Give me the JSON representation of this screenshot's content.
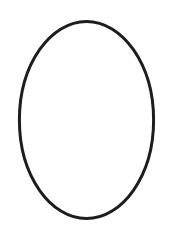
{
  "canvas": {
    "width": 173,
    "height": 229,
    "background_color": "#ffffff",
    "title": ""
  },
  "figure": {
    "name": "ellipse-outline",
    "shape_type": "ellipse",
    "description": "Hand-drawn vertical oval outline",
    "filled": false,
    "fill_color": "none",
    "stroke_color": "#1d1d1d",
    "stroke_width": 3.0,
    "center_x": 86.5,
    "center_y": 120,
    "radius_x": 67,
    "radius_y": 99,
    "bounds": {
      "left": 19,
      "top": 21,
      "right": 154,
      "bottom": 219,
      "width": 135,
      "height": 198
    },
    "path": "M 86.5,21.4 C 122.2,21.4 153.6,64.0 153.6,120.0 C 153.6,176.0 122.2,218.6 86.5,218.6 C 50.8,218.6 19.4,176.0 19.4,120.0 C 19.4,64.0 50.8,21.4 86.5,21.4 Z"
  },
  "labels": [],
  "annotations": []
}
